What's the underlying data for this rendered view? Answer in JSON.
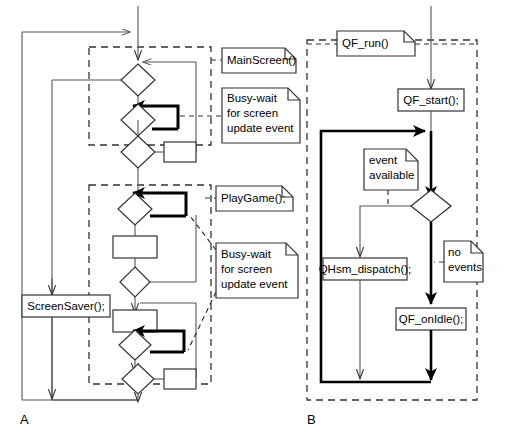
{
  "figure": {
    "title": "",
    "panels": [
      {
        "id": "A",
        "label": "A"
      },
      {
        "id": "B",
        "label": "B"
      }
    ]
  },
  "panel_a": {
    "label": "A",
    "notes": [
      {
        "id": "mainscreen",
        "lines": [
          "MainScreen()"
        ]
      },
      {
        "id": "busywait1",
        "lines": [
          "Busy-wait",
          "for screen",
          "update event"
        ]
      },
      {
        "id": "playgame",
        "lines": [
          "PlayGame();"
        ]
      },
      {
        "id": "busywait2",
        "lines": [
          "Busy-wait",
          "for screen",
          "update event"
        ]
      }
    ],
    "actions": [
      {
        "id": "screensaver",
        "label": "ScreenSaver();"
      }
    ]
  },
  "panel_b": {
    "label": "B",
    "notes": [
      {
        "id": "qfrun",
        "lines": [
          "QF_run()"
        ]
      },
      {
        "id": "event-available",
        "lines": [
          "event",
          "available"
        ]
      },
      {
        "id": "no-events",
        "lines": [
          "no",
          "events"
        ]
      }
    ],
    "actions": [
      {
        "id": "qfstart",
        "label": "QF_start();"
      },
      {
        "id": "qhsmdispatch",
        "label": "QHsm_dispatch();"
      },
      {
        "id": "qfonidle",
        "label": "QF_onIdle();"
      }
    ]
  },
  "colors": {
    "stroke": "#1a1a1a",
    "thin": "#555555",
    "bold": "#000000",
    "background": "#ffffff"
  }
}
